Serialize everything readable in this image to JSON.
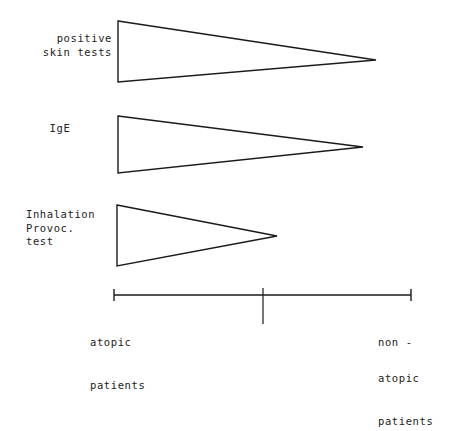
{
  "figure": {
    "background_color": "#ffffff",
    "ink_color": "#1a1a1a"
  },
  "rows": [
    {
      "id": "positive-skin-tests",
      "label_lines": [
        "positive",
        "skin tests"
      ],
      "label_text": "positive\nskin tests",
      "label_align": "right",
      "wedge": {
        "base_x": 118,
        "base_top_y": 21,
        "base_bottom_y": 82,
        "tip_x": 376,
        "tip_y": 60
      }
    },
    {
      "id": "ige",
      "label_lines": [
        "IgE"
      ],
      "label_text": "IgE",
      "label_align": "center",
      "wedge": {
        "base_x": 118,
        "base_top_y": 116,
        "base_bottom_y": 173,
        "tip_x": 363,
        "tip_y": 147
      }
    },
    {
      "id": "inhalation-provocation-test",
      "label_lines": [
        "Inhalation",
        "Provoc.",
        "test"
      ],
      "label_text": "Inhalation\nProvoc.\ntest",
      "label_align": "left",
      "wedge": {
        "base_x": 117,
        "base_top_y": 205,
        "base_bottom_y": 266,
        "tip_x": 277,
        "tip_y": 236
      }
    }
  ],
  "axis": {
    "y": 295,
    "x_start": 114,
    "x_end": 411,
    "x_mid": 263,
    "end_tick_half_height": 6,
    "mid_tick_top": 288,
    "mid_tick_bottom": 324,
    "left_label": {
      "lines": [
        "atopic",
        "patients"
      ],
      "text": "atopic\npatients"
    },
    "right_label": {
      "lines": [
        "non -",
        "atopic",
        "patients"
      ],
      "text": "non -\natopic\npatients"
    }
  },
  "chart_data": {
    "type": "area",
    "xlabel": "",
    "ylabel": "",
    "grid": false,
    "legend_position": "none",
    "x_axis": {
      "left_label": "atopic patients",
      "right_label": "non - atopic patients",
      "ticks": [
        {
          "label": "atopic patients",
          "x_px": 114
        },
        {
          "label": "",
          "x_px": 263
        },
        {
          "label": "non - atopic patients",
          "x_px": 411
        }
      ],
      "range_px": [
        114,
        411
      ]
    },
    "series": [
      {
        "name": "positive skin tests",
        "shape": "wedge",
        "magnitude_at_left": 1.0,
        "magnitude_at_right": 0.0,
        "extent_fraction_of_axis": 0.88,
        "base_height_px": 61,
        "tip_x_px": 376
      },
      {
        "name": "IgE",
        "shape": "wedge",
        "magnitude_at_left": 0.93,
        "magnitude_at_right": 0.0,
        "extent_fraction_of_axis": 0.82,
        "base_height_px": 57,
        "tip_x_px": 363
      },
      {
        "name": "Inhalation Provoc. test",
        "shape": "wedge",
        "magnitude_at_left": 1.0,
        "magnitude_at_right": 0.0,
        "extent_fraction_of_axis": 0.55,
        "base_height_px": 61,
        "tip_x_px": 277
      }
    ]
  }
}
